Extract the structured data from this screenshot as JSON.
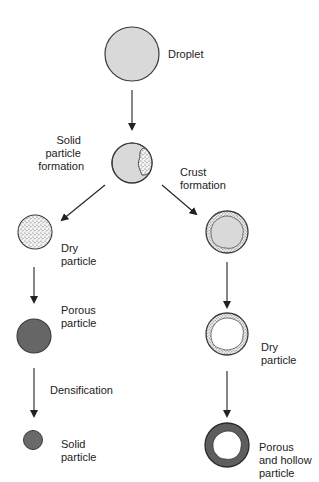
{
  "diagram": {
    "type": "flow-diagram",
    "topic": "Particle formation from a droplet during drying",
    "colors": {
      "droplet_fill": "#d9d9d9",
      "outline": "#3a3a3a",
      "porous_fill": "#666666",
      "solid_fill": "#6a6a6a",
      "shell_fill": "#5e5e5e",
      "arrow": "#222222"
    },
    "nodes": {
      "droplet": {
        "label": "Droplet"
      },
      "initial": {
        "label": ""
      },
      "dry_left": {
        "label_lines": [
          "Dry",
          "particle"
        ]
      },
      "porous": {
        "label_lines": [
          "Porous",
          "particle"
        ]
      },
      "solid": {
        "label_lines": [
          "Solid",
          "particle"
        ]
      },
      "crust": {
        "label": ""
      },
      "dry_right": {
        "label_lines": [
          "Dry",
          "particle"
        ]
      },
      "hollow": {
        "label_lines": [
          "Porous",
          "and hollow",
          "particle"
        ]
      }
    },
    "edges": {
      "solid_formation": {
        "label_lines": [
          "Solid",
          "particle",
          "formation"
        ]
      },
      "crust_formation": {
        "label_lines": [
          "Crust",
          "formation"
        ]
      },
      "densification": {
        "label": "Densification"
      }
    }
  }
}
